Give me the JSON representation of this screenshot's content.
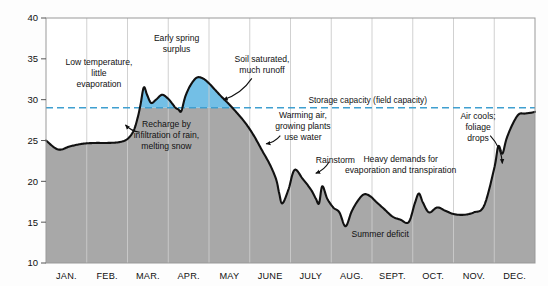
{
  "chart_data": {
    "type": "area",
    "title": "",
    "xlabel": "",
    "ylabel": "Centimeters of water in upper meter of soil",
    "ylim": [
      10,
      40
    ],
    "yticks": [
      10,
      15,
      20,
      25,
      30,
      35,
      40
    ],
    "ytick_labels": [
      "10",
      "15",
      "20",
      "25",
      "30",
      "35",
      "40"
    ],
    "grid": "vertical-month-lines",
    "legend": "none",
    "categories": [
      "JAN.",
      "FEB.",
      "MAR.",
      "APR.",
      "MAY",
      "JUNE",
      "JULY",
      "AUG.",
      "SEPT.",
      "OCT.",
      "NOV.",
      "DEC."
    ],
    "field_capacity": 29,
    "field_capacity_label": "Storage capacity (field capacity)",
    "colors": {
      "surplus_fill": "#73bfe6",
      "deficit_fill": "#a8a8a8",
      "curve": "#111111",
      "capacity_line": "#3f9fd0",
      "gridline": "#cccccc",
      "frame": "#999999"
    },
    "series": [
      {
        "name": "Soil moisture",
        "units": "cm of water in upper meter of soil",
        "x": [
          0.0,
          0.3,
          0.6,
          0.9,
          1.2,
          1.5,
          1.8,
          2.0,
          2.15,
          2.25,
          2.32,
          2.4,
          2.48,
          2.58,
          2.7,
          2.85,
          3.0,
          3.1,
          3.18,
          3.25,
          3.32,
          3.42,
          3.55,
          3.7,
          3.85,
          4.0,
          4.15,
          4.3,
          4.5,
          4.7,
          4.9,
          5.1,
          5.3,
          5.5,
          5.65,
          5.72,
          5.8,
          5.95,
          6.1,
          6.3,
          6.5,
          6.62,
          6.7,
          6.78,
          6.9,
          7.05,
          7.2,
          7.35,
          7.5,
          7.65,
          7.8,
          7.95,
          8.1,
          8.3,
          8.5,
          8.7,
          8.9,
          9.05,
          9.15,
          9.25,
          9.4,
          9.6,
          9.8,
          10.0,
          10.25,
          10.5,
          10.75,
          11.0,
          11.1,
          11.2,
          11.3,
          11.45,
          11.6,
          11.75,
          11.9,
          12.0
        ],
        "y": [
          25.0,
          23.9,
          24.3,
          24.6,
          24.7,
          24.7,
          24.8,
          25.2,
          26.2,
          27.8,
          29.4,
          31.5,
          30.6,
          29.6,
          30.0,
          30.6,
          30.1,
          29.5,
          29.0,
          28.8,
          28.6,
          30.4,
          31.8,
          32.7,
          32.6,
          32.0,
          31.2,
          30.4,
          29.4,
          28.3,
          27.1,
          25.6,
          23.8,
          22.0,
          20.2,
          18.6,
          17.3,
          19.0,
          21.4,
          20.3,
          19.0,
          17.9,
          17.3,
          19.4,
          17.9,
          16.8,
          16.2,
          14.5,
          16.3,
          17.6,
          18.4,
          18.2,
          17.5,
          16.6,
          15.7,
          15.3,
          15.0,
          17.3,
          18.5,
          17.4,
          16.2,
          16.8,
          16.4,
          16.0,
          15.9,
          16.2,
          17.0,
          21.6,
          24.3,
          23.4,
          25.2,
          27.0,
          28.2,
          28.3,
          28.4,
          28.5
        ]
      }
    ],
    "annotations": [
      {
        "id": "low-temperature",
        "text": "Low temperature,\nlittle\nevaporation",
        "x_month": 1.3,
        "y_value": 33.2
      },
      {
        "id": "early-spring-surplus",
        "text": "Early spring\nsurplus",
        "x_month": 3.2,
        "y_value": 36.8
      },
      {
        "id": "soil-saturated",
        "text": "Soil saturated,\nmuch runoff",
        "x_month": 5.3,
        "y_value": 34.3
      },
      {
        "id": "storage-capacity",
        "text": "Storage capacity (field capacity)",
        "x_month": 7.9,
        "y_value": 29.9
      },
      {
        "id": "recharge",
        "text": "Recharge by\ninfiltration of rain,\nmelting snow",
        "x_month": 2.95,
        "y_value": 25.6
      },
      {
        "id": "warming-air",
        "text": "Warming air,\ngrowing plants\nuse water",
        "x_month": 6.3,
        "y_value": 26.7
      },
      {
        "id": "rainstorm",
        "text": "Rainstorm",
        "x_month": 7.1,
        "y_value": 22.6
      },
      {
        "id": "heavy-demands",
        "text": "Heavy demands for\nevaporation and transpiration",
        "x_month": 8.7,
        "y_value": 22.0
      },
      {
        "id": "summer-deficit",
        "text": "Summer deficit",
        "x_month": 8.2,
        "y_value": 13.5
      },
      {
        "id": "air-cools",
        "text": "Air cools;\nfoliage\ndrops",
        "x_month": 10.6,
        "y_value": 26.6
      }
    ],
    "leaders": [
      {
        "id": "leader-soil-saturated",
        "from": [
          5.05,
          32.6
        ],
        "to": [
          4.35,
          30.0
        ]
      },
      {
        "id": "leader-recharge",
        "from": [
          2.3,
          26.0
        ],
        "to": [
          1.95,
          26.9
        ]
      },
      {
        "id": "leader-warming-air",
        "from": [
          5.75,
          25.6
        ],
        "to": [
          5.4,
          24.6
        ]
      },
      {
        "id": "leader-rainstorm",
        "from": [
          6.95,
          22.4
        ],
        "to": [
          6.62,
          21.0
        ]
      },
      {
        "id": "leader-air-cools",
        "from": [
          10.9,
          25.6
        ],
        "to": [
          11.2,
          22.2
        ]
      }
    ]
  }
}
